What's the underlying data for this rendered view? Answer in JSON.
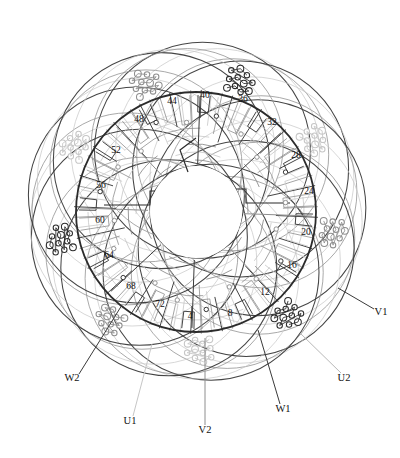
{
  "diagram": {
    "type": "circular-winding-schematic",
    "background": "#ffffff",
    "center": {
      "x": 196,
      "y": 212
    },
    "main_ring_radius": 120,
    "hub_radius": 42,
    "colors": {
      "dark": "#3a3a3a",
      "darker": "#2b2b2b",
      "mid": "#8e8e8e",
      "light": "#c6c6c6",
      "lighter": "#dcdcdc",
      "text": "#111111"
    },
    "slot_labels": [
      {
        "text": "4",
        "x": 190,
        "y": 319
      },
      {
        "text": "8",
        "x": 230,
        "y": 316
      },
      {
        "text": "12",
        "x": 265,
        "y": 295
      },
      {
        "text": "16",
        "x": 292,
        "y": 268
      },
      {
        "text": "20",
        "x": 306,
        "y": 235
      },
      {
        "text": "24",
        "x": 309,
        "y": 194
      },
      {
        "text": "28",
        "x": 296,
        "y": 158
      },
      {
        "text": "32",
        "x": 272,
        "y": 125
      },
      {
        "text": "36",
        "x": 243,
        "y": 102
      },
      {
        "text": "40",
        "x": 205,
        "y": 98
      },
      {
        "text": "44",
        "x": 172,
        "y": 104
      },
      {
        "text": "48",
        "x": 139,
        "y": 122
      },
      {
        "text": "52",
        "x": 116,
        "y": 153
      },
      {
        "text": "56",
        "x": 101,
        "y": 188
      },
      {
        "text": "60",
        "x": 100,
        "y": 223
      },
      {
        "text": "64",
        "x": 109,
        "y": 258
      },
      {
        "text": "68",
        "x": 131,
        "y": 289
      },
      {
        "text": "72",
        "x": 160,
        "y": 307
      }
    ],
    "terminals": [
      {
        "text": "V1",
        "x": 381,
        "y": 315,
        "anchor": "middle",
        "leader": {
          "x1": 374,
          "y1": 309,
          "x2": 338,
          "y2": 288
        },
        "color": "#3a3a3a"
      },
      {
        "text": "U2",
        "x": 344,
        "y": 381,
        "anchor": "middle",
        "leader": {
          "x1": 341,
          "y1": 373,
          "x2": 300,
          "y2": 333
        },
        "color": "#b8b8b8"
      },
      {
        "text": "W1",
        "x": 283,
        "y": 412,
        "anchor": "middle",
        "leader": {
          "x1": 280,
          "y1": 404,
          "x2": 258,
          "y2": 330
        },
        "color": "#3a3a3a"
      },
      {
        "text": "V2",
        "x": 205,
        "y": 433,
        "anchor": "middle",
        "leader": {
          "x1": 205,
          "y1": 425,
          "x2": 205,
          "y2": 338
        },
        "color": "#8e8e8e"
      },
      {
        "text": "U1",
        "x": 130,
        "y": 424,
        "anchor": "middle",
        "leader": {
          "x1": 133,
          "y1": 416,
          "x2": 152,
          "y2": 344
        },
        "color": "#c6c6c6"
      },
      {
        "text": "W2",
        "x": 72,
        "y": 381,
        "anchor": "middle",
        "leader": {
          "x1": 79,
          "y1": 374,
          "x2": 122,
          "y2": 305
        },
        "color": "#3a3a3a"
      }
    ],
    "petal_count": 9,
    "phase_groups": [
      {
        "name": "U",
        "tone": "light"
      },
      {
        "name": "V",
        "tone": "dark"
      },
      {
        "name": "W",
        "tone": "mid"
      }
    ]
  }
}
